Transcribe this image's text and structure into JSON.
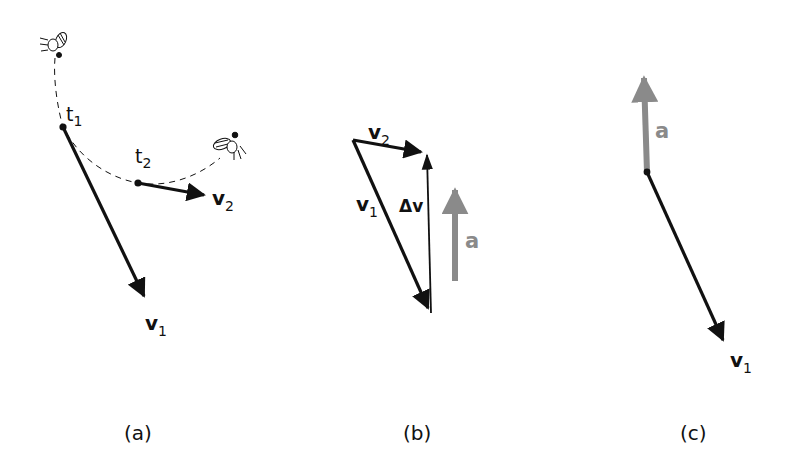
{
  "figure": {
    "panels": [
      {
        "id": "a",
        "caption": "(a)",
        "labels": {
          "t1": "t",
          "t1_sub": "1",
          "t2": "t",
          "t2_sub": "2",
          "v1": "v",
          "v1_sub": "1",
          "v2": "v",
          "v2_sub": "2"
        },
        "elements": [
          "fly-start-icon",
          "fly-end-icon",
          "dashed-trajectory",
          "velocity-vector-v1",
          "velocity-vector-v2"
        ]
      },
      {
        "id": "b",
        "caption": "(b)",
        "labels": {
          "v1": "v",
          "v1_sub": "1",
          "v2": "v",
          "v2_sub": "2",
          "delta_v": "Δv",
          "a": "a"
        },
        "elements": [
          "vector-v1",
          "vector-v2",
          "vector-delta-v",
          "vector-a"
        ]
      },
      {
        "id": "c",
        "caption": "(c)",
        "labels": {
          "a": "a",
          "v1": "v",
          "v1_sub": "1"
        },
        "elements": [
          "vector-a",
          "vector-v1"
        ]
      }
    ]
  },
  "colors": {
    "ink": "#111111",
    "acceleration": "#8a8a8a",
    "background": "#ffffff"
  }
}
